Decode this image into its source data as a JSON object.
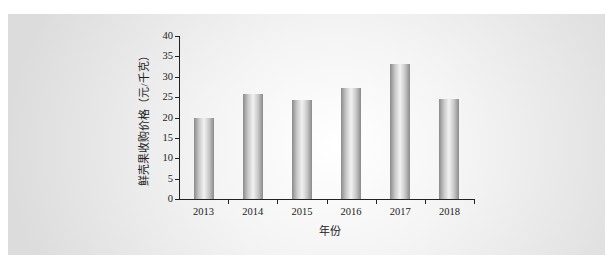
{
  "chart_data": {
    "type": "bar",
    "title": "",
    "xlabel": "年份",
    "ylabel": "鲜壳果收购价格（元/千克）",
    "categories": [
      "2013",
      "2014",
      "2015",
      "2016",
      "2017",
      "2018"
    ],
    "values": [
      20,
      25.8,
      24.4,
      27.2,
      33.2,
      24.6
    ],
    "ylim": [
      0,
      40
    ],
    "yticks": [
      "0",
      "5",
      "10",
      "15",
      "20",
      "25",
      "30",
      "35",
      "40"
    ],
    "grid": false,
    "legend": null
  }
}
